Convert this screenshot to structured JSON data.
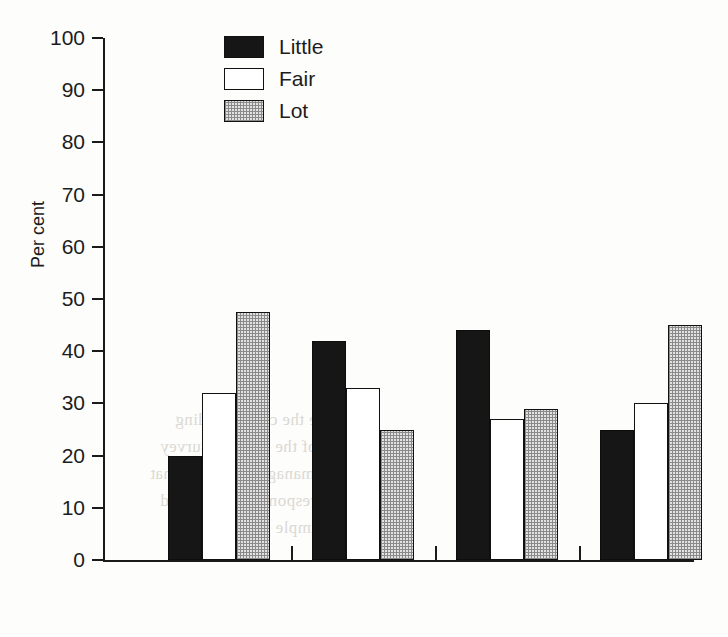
{
  "chart_data": {
    "type": "bar",
    "title": "",
    "xlabel": "",
    "ylabel": "Per cent",
    "ylim": [
      0,
      100
    ],
    "ytick_step": 10,
    "ytick_labels": [
      "0",
      "10",
      "20",
      "30",
      "40",
      "50",
      "60",
      "70",
      "80",
      "90",
      "100"
    ],
    "grid": false,
    "legend_position": "top-left-inside",
    "categories": [
      "Multi.",
      "BR",
      "Hosp.",
      "FinCo"
    ],
    "series": [
      {
        "name": "Little",
        "fill": "solid-black",
        "color": "#161616",
        "values": [
          20,
          42,
          44,
          25
        ]
      },
      {
        "name": "Fair",
        "fill": "white-outline",
        "color": "#ffffff",
        "values": [
          32,
          33,
          27,
          30
        ]
      },
      {
        "name": "Lot",
        "fill": "stipple-checker",
        "color": "#e2e2e2",
        "values": [
          47.5,
          25,
          29,
          45
        ]
      }
    ]
  },
  "axis": {
    "y_title": "Per cent"
  },
  "legend": {
    "items": [
      {
        "label": "Little"
      },
      {
        "label": "Fair"
      },
      {
        "label": "Lot"
      }
    ]
  },
  "background_bleed": {
    "lines": [
      "and the the corresponding",
      "of the relevant survey",
      "managers reported that",
      "respondents indicated",
      "the sample group showed"
    ]
  }
}
